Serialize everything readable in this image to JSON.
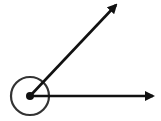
{
  "diagram": {
    "type": "angle",
    "background": "#ffffff",
    "stroke_color": "#111111",
    "circle_color": "#333333",
    "vertex": {
      "x": 30,
      "y": 96
    },
    "vertex_dot_radius": 4,
    "angle_marker_circle": {
      "cx": 30,
      "cy": 96,
      "r": 19
    },
    "rays": [
      {
        "name": "upper-ray",
        "x1": 30,
        "y1": 96,
        "x2": 116,
        "y2": 5
      },
      {
        "name": "horizontal-ray",
        "x1": 30,
        "y1": 96,
        "x2": 153,
        "y2": 96
      }
    ]
  }
}
